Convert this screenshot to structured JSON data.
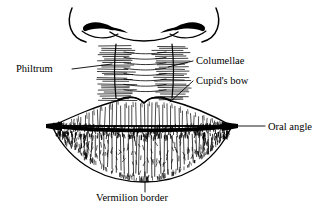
{
  "figure": {
    "background_color": "#ffffff",
    "ink_color": "#000000",
    "width": 332,
    "height": 214
  },
  "labels": [
    {
      "id": "philtrum",
      "text": "Philtrum",
      "text_x": 16,
      "text_y": 72,
      "anchor": "start",
      "leader": "M 72,69 L 112,64",
      "target": "philtrum-column"
    },
    {
      "id": "columellae",
      "text": "Columellae",
      "text_x": 196,
      "text_y": 64,
      "anchor": "start",
      "leader": "M 193,61 L 168,67",
      "target": "columellae-ridges"
    },
    {
      "id": "cupids-bow",
      "text": "Cupid's bow",
      "text_x": 196,
      "text_y": 84,
      "anchor": "start",
      "leader": "M 193,81 L 170,102",
      "target": "upper-lip-bow"
    },
    {
      "id": "oral-angle",
      "text": "Oral angle",
      "text_x": 268,
      "text_y": 130,
      "anchor": "start",
      "leader": "M 265,126 L 232,126",
      "target": "lip-corner-right"
    },
    {
      "id": "vermilion-border",
      "text": "Vermilion border",
      "text_x": 96,
      "text_y": 201,
      "anchor": "start",
      "leader": "M 145,172 L 145,192",
      "target": "lower-lip-edge"
    }
  ],
  "anatomy": {
    "nose": {
      "name": "nose-base",
      "left_ala": "M 72,8 C 66,22 70,38 86,42",
      "right_ala": "M 216,8 C 222,22 218,38 202,42",
      "left_nostril": "M 86,28 C 92,24 102,25 110,29 C 103,33 92,33 86,28 Z",
      "right_nostril": "M 202,28 C 196,24 186,25 178,29 C 185,33 196,33 202,28 Z",
      "columella_base": "M 110,32 C 126,44 162,44 178,32"
    },
    "philtrum": {
      "name": "philtrum-column",
      "left_ridge": "M 116,44 C 114,62 114,80 116,98",
      "right_ridge": "M 172,44 C 174,62 174,80 172,98",
      "rungs": 9
    },
    "upper_lip": {
      "name": "upper-lip",
      "outline": "M 52,126 C 74,116 96,106 120,100 C 132,95 140,99 144,103 C 148,99 156,95 168,100 C 192,106 214,116 232,126 Z",
      "bow_notch_x": 144,
      "hatch_count": 46
    },
    "oral_fissure": {
      "name": "oral-fissure-line",
      "path": "M 52,126 C 100,131 188,131 232,126"
    },
    "lower_lip": {
      "name": "lower-lip",
      "outline": "M 52,126 C 72,168 110,182 144,182 C 178,182 212,168 232,126 Z",
      "hatch_count": 44
    }
  }
}
